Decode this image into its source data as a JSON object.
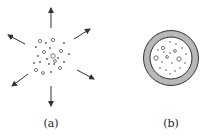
{
  "panels": [
    {
      "id": "a",
      "label": "(a)",
      "description": "particles dispersing outward",
      "center": [
        51,
        55
      ],
      "arrow_count": 6
    },
    {
      "id": "b",
      "label": "(b)",
      "description": "particles enclosed in shell",
      "center": [
        171,
        58
      ],
      "outer_radius": 28,
      "inner_radius": 21
    }
  ],
  "colors": {
    "stroke": "#333333",
    "shell_fill": "#b8b8b8",
    "particle": "#555555"
  }
}
